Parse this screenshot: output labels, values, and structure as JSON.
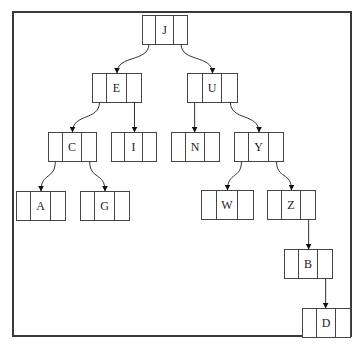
{
  "diagram": {
    "type": "binary-search-tree",
    "nodes": [
      {
        "id": "J",
        "label": "J",
        "x": 142,
        "y": 15,
        "w": 46
      },
      {
        "id": "E",
        "label": "E",
        "x": 92,
        "y": 73,
        "w": 50
      },
      {
        "id": "U",
        "label": "U",
        "x": 187,
        "y": 73,
        "w": 51
      },
      {
        "id": "C",
        "label": "C",
        "x": 48,
        "y": 132,
        "w": 49
      },
      {
        "id": "I",
        "label": "I",
        "x": 111,
        "y": 132,
        "w": 46
      },
      {
        "id": "N",
        "label": "N",
        "x": 171,
        "y": 132,
        "w": 49
      },
      {
        "id": "Y",
        "label": "Y",
        "x": 234,
        "y": 132,
        "w": 50
      },
      {
        "id": "A",
        "label": "A",
        "x": 16,
        "y": 191,
        "w": 50
      },
      {
        "id": "G",
        "label": "G",
        "x": 80,
        "y": 191,
        "w": 50
      },
      {
        "id": "W",
        "label": "W",
        "x": 201,
        "y": 190,
        "w": 53
      },
      {
        "id": "Z",
        "label": "Z",
        "x": 267,
        "y": 190,
        "w": 49
      },
      {
        "id": "B",
        "label": "B",
        "x": 284,
        "y": 249,
        "w": 49
      },
      {
        "id": "D",
        "label": "D",
        "x": 302,
        "y": 308,
        "w": 49
      }
    ],
    "edges": [
      {
        "from": "J",
        "to": "E",
        "side": "left"
      },
      {
        "from": "J",
        "to": "U",
        "side": "right"
      },
      {
        "from": "E",
        "to": "C",
        "side": "left"
      },
      {
        "from": "E",
        "to": "I",
        "side": "right"
      },
      {
        "from": "U",
        "to": "N",
        "side": "left"
      },
      {
        "from": "U",
        "to": "Y",
        "side": "right"
      },
      {
        "from": "C",
        "to": "A",
        "side": "left"
      },
      {
        "from": "C",
        "to": "G",
        "side": "right"
      },
      {
        "from": "Y",
        "to": "W",
        "side": "left"
      },
      {
        "from": "Y",
        "to": "Z",
        "side": "right"
      },
      {
        "from": "Z",
        "to": "B",
        "side": "right"
      },
      {
        "from": "B",
        "to": "D",
        "side": "right"
      }
    ]
  }
}
